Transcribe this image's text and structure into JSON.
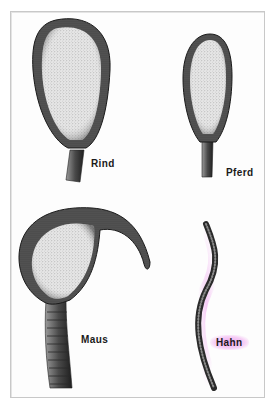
{
  "figure": {
    "panels": [
      {
        "id": "rind",
        "label": "Rind",
        "highlighted": false
      },
      {
        "id": "pferd",
        "label": "Pferd",
        "highlighted": false
      },
      {
        "id": "maus",
        "label": "Maus",
        "highlighted": false
      },
      {
        "id": "hahn",
        "label": "Hahn",
        "highlighted": true
      }
    ],
    "colors": {
      "ink": "#1a1a1a",
      "stipple_light": "#d9d9d9",
      "stipple_dark": "#3a3a3a",
      "frame_border": "#c8c8c8",
      "highlight": "#ec96ec"
    }
  }
}
